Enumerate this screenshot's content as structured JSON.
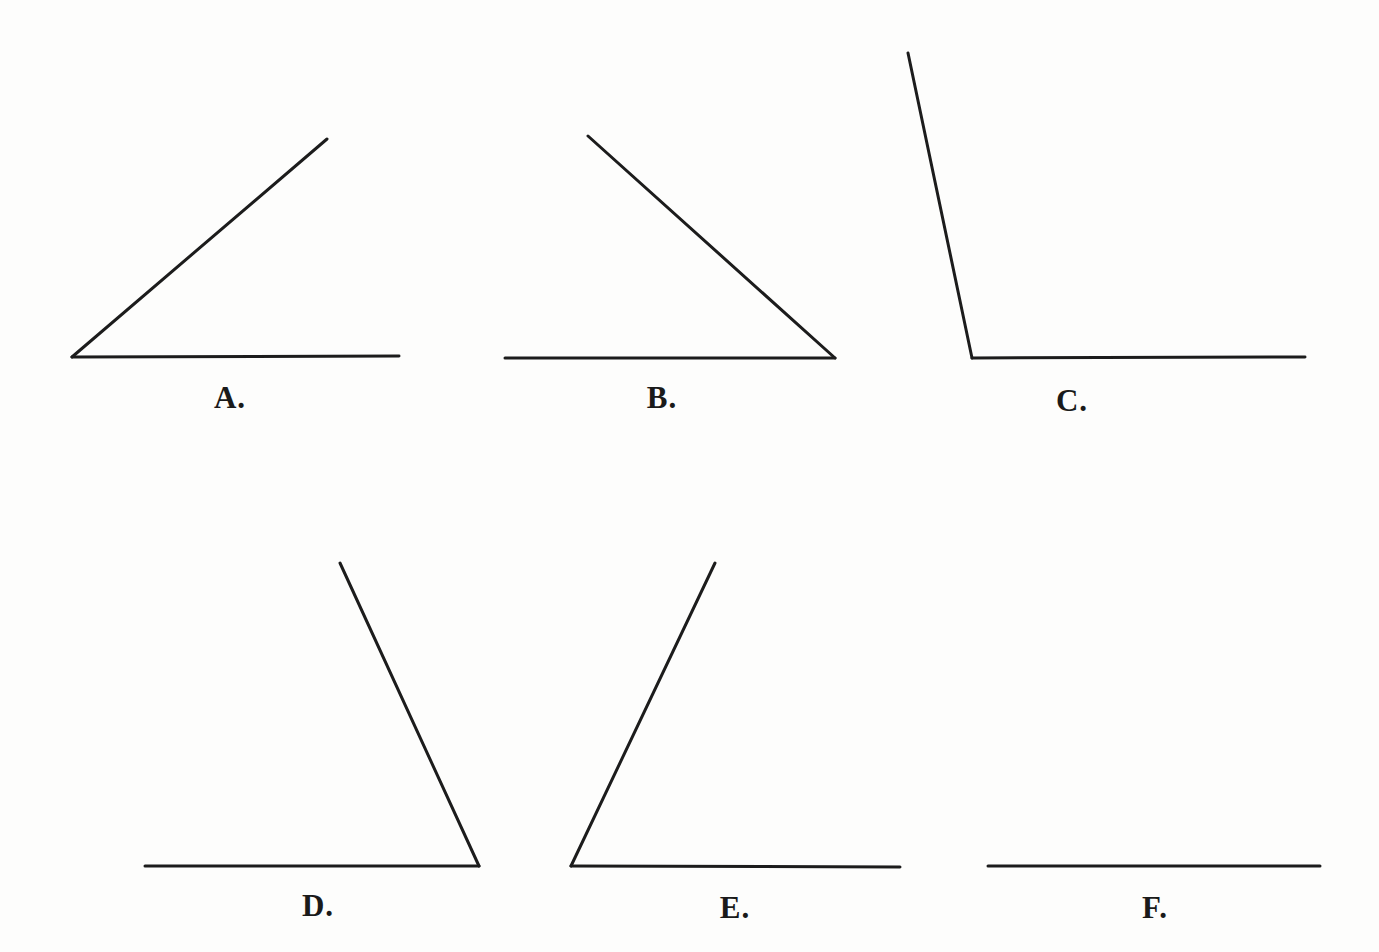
{
  "page": {
    "background_color": "#fdfdfc",
    "line_color": "#1c1c1c",
    "label_color": "#1a1a1a"
  },
  "chart_data": {
    "type": "diagram-angles",
    "canvas": {
      "width": 1379,
      "height": 952
    },
    "figures": [
      {
        "id": "A",
        "label": "A.",
        "angle_type": "acute",
        "angle_degrees": 40,
        "vertex": [
          72,
          357
        ],
        "ray_ends": [
          [
            399,
            356
          ],
          [
            327,
            139
          ]
        ],
        "label_pos": [
          230,
          397
        ]
      },
      {
        "id": "B",
        "label": "B.",
        "angle_type": "acute",
        "angle_degrees": 42,
        "vertex": [
          835,
          358
        ],
        "ray_ends": [
          [
            505,
            358
          ],
          [
            588,
            136
          ]
        ],
        "label_pos": [
          662,
          397
        ]
      },
      {
        "id": "C",
        "label": "C.",
        "angle_type": "obtuse",
        "angle_degrees": 102,
        "vertex": [
          972,
          358
        ],
        "ray_ends": [
          [
            1305,
            357
          ],
          [
            908,
            53
          ]
        ],
        "label_pos": [
          1072,
          400
        ]
      },
      {
        "id": "D",
        "label": "D.",
        "angle_type": "acute",
        "angle_degrees": 65,
        "vertex": [
          479,
          866
        ],
        "ray_ends": [
          [
            145,
            866
          ],
          [
            340,
            563
          ]
        ],
        "label_pos": [
          318,
          905
        ]
      },
      {
        "id": "E",
        "label": "E.",
        "angle_type": "acute",
        "angle_degrees": 64,
        "vertex": [
          571,
          866
        ],
        "ray_ends": [
          [
            900,
            867
          ],
          [
            715,
            563
          ]
        ],
        "label_pos": [
          735,
          907
        ]
      },
      {
        "id": "F",
        "label": "F.",
        "angle_type": "straight",
        "angle_degrees": 180,
        "vertex": [
          988,
          866
        ],
        "ray_ends": [
          [
            1320,
            866
          ]
        ],
        "label_pos": [
          1155,
          907
        ]
      }
    ]
  }
}
